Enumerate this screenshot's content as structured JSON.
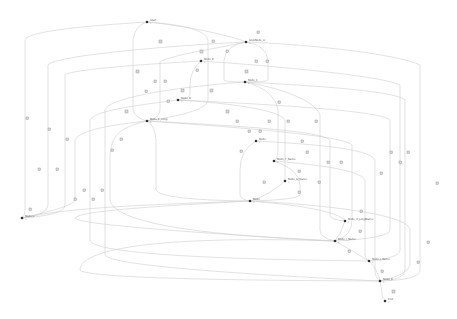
{
  "diagram": {
    "type": "directed-graph",
    "colors": {
      "edge": "#cfcfcf",
      "node": "#333333",
      "edge_label_fill": "#d9d9d9",
      "edge_label_stroke": "#8a8a8a"
    },
    "nodes": [
      {
        "id": "n1",
        "x": 147,
        "y": 22,
        "label": "Start",
        "sub": "1"
      },
      {
        "id": "n2",
        "x": 246,
        "y": 42,
        "label": "StepNode_A",
        "sub": "1"
      },
      {
        "id": "n3",
        "x": 201,
        "y": 61,
        "label": "Node_B",
        "sub": "1"
      },
      {
        "id": "n4",
        "x": 245,
        "y": 82,
        "label": "Node_C",
        "sub": "1"
      },
      {
        "id": "n5",
        "x": 178,
        "y": 100,
        "label": "Node_D",
        "sub": "1"
      },
      {
        "id": "n6",
        "x": 147,
        "y": 121,
        "label": "Node_E_Long",
        "sub": "1"
      },
      {
        "id": "n7",
        "x": 256,
        "y": 141,
        "label": "Node",
        "sub": "1"
      },
      {
        "id": "n8",
        "x": 274,
        "y": 161,
        "label": "Node_F_Name",
        "sub": "1"
      },
      {
        "id": "n9",
        "x": 285,
        "y": 181,
        "label": "Node_G_Name",
        "sub": "1"
      },
      {
        "id": "n10",
        "x": 250,
        "y": 201,
        "label": "Node",
        "sub": "1"
      },
      {
        "id": "n11",
        "x": 345,
        "y": 221,
        "label": "Node_H_LongName",
        "sub": "1"
      },
      {
        "id": "n12",
        "x": 335,
        "y": 241,
        "label": "Node_I_Name",
        "sub": "1"
      },
      {
        "id": "n13",
        "x": 369,
        "y": 261,
        "label": "Node_J_Name",
        "sub": "1"
      },
      {
        "id": "n14",
        "x": 380,
        "y": 281,
        "label": "Node_K",
        "sub": "1"
      },
      {
        "id": "n15",
        "x": 385,
        "y": 301,
        "label": "End",
        "sub": "1"
      },
      {
        "id": "n16",
        "x": 22,
        "y": 218,
        "label": "Node_L",
        "sub": "1"
      }
    ],
    "note": "Node labels are illegible at source resolution; placeholder text used."
  }
}
